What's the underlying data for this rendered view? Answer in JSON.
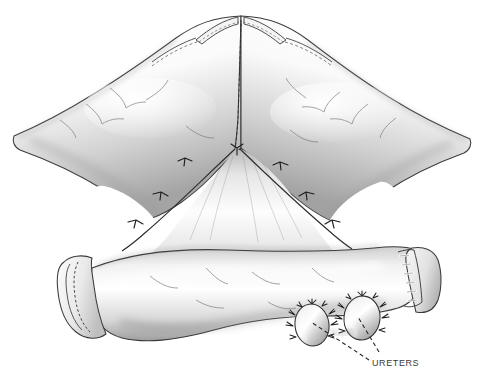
{
  "figure": {
    "kind": "medical-surgical-illustration",
    "style": "pencil-and-wash grayscale line drawing",
    "background_color": "#ffffff",
    "ink_color": "#2b2b2b",
    "shadow_color": "#8d8d8d",
    "width": 482,
    "height": 387
  },
  "labels": [
    {
      "id": "ureters",
      "text": "URETERS",
      "x": 372,
      "y": 358,
      "color": "#3a3a3a",
      "font_size": 9,
      "transform": "uppercase"
    }
  ],
  "leader_lines": [
    {
      "id": "leader-left-ureter",
      "style": "dashed",
      "from_x": 369,
      "from_y": 360,
      "to_x": 311,
      "to_y": 322
    },
    {
      "id": "leader-right-ureter",
      "style": "dashed",
      "from_x": 378,
      "from_y": 352,
      "to_x": 358,
      "to_y": 318
    }
  ],
  "anatomy": {
    "upper_limbs": {
      "name": "detubularized ileal limbs forming the pouch roof",
      "apex_x": 241,
      "apex_y": 14,
      "left_tip_x": 12,
      "right_tip_x": 470
    },
    "midline_suture": {
      "name": "posterior midline closure",
      "top_y": 20,
      "bottom_y": 148
    },
    "chevron_anastomosis": {
      "name": "inverted-V interrupted suture line",
      "apex_x": 232,
      "apex_y": 148,
      "suture_count_per_side": 4
    },
    "fenestrations": [
      {
        "id": "window-left",
        "cx": 112,
        "cy": 205
      },
      {
        "id": "window-right",
        "cx": 360,
        "cy": 200
      }
    ],
    "lower_segment": {
      "name": "afferent ileal segment / efferent limb",
      "left_x": 62,
      "right_x": 432,
      "center_y": 285
    },
    "left_closure": {
      "name": "oversewn running suture end",
      "type": "running-suture",
      "x": 74,
      "y": 292
    },
    "right_closure": {
      "name": "stapled closed end",
      "type": "staple-line",
      "x": 405,
      "y": 275,
      "staple_count": 7
    },
    "ureteral_stumps": [
      {
        "id": "ureter-left",
        "cx": 312,
        "cy": 325,
        "rx": 17,
        "ry": 21,
        "sutures": 11
      },
      {
        "id": "ureter-right",
        "cx": 362,
        "cy": 318,
        "rx": 18,
        "ry": 22,
        "sutures": 11
      }
    ]
  }
}
